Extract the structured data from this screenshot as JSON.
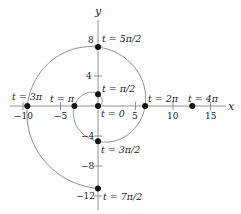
{
  "chart_data": {
    "type": "line",
    "title": "",
    "xlabel": "x",
    "ylabel": "y",
    "xlim": [
      -12,
      17
    ],
    "ylim": [
      -14,
      13
    ],
    "grid": false,
    "x_ticks": [
      -10,
      -5,
      5,
      10,
      15
    ],
    "x_tick_labels": [
      "−10",
      "−5",
      "5",
      "10",
      "15"
    ],
    "y_ticks": [
      8,
      4,
      -4,
      -8,
      -12
    ],
    "y_tick_labels": [
      "8",
      "4",
      "−4",
      "−8",
      "−12"
    ],
    "series": [
      {
        "name": "spiral",
        "param": "t",
        "t_range": [
          0,
          10.9956
        ],
        "x_expr": "t*cos(t)",
        "y_expr": "t*sin(t)",
        "color": "#888888"
      }
    ],
    "points": [
      {
        "label": "t = 0",
        "x": 0,
        "y": 0
      },
      {
        "label": "t = π/2",
        "x": 0,
        "y": 1.5708
      },
      {
        "label": "t = π",
        "x": -3.1416,
        "y": 0
      },
      {
        "label": "t = 3π/2",
        "x": 0,
        "y": -4.7124
      },
      {
        "label": "t = 2π",
        "x": 6.2832,
        "y": 0
      },
      {
        "label": "t = 5π/2",
        "x": 0,
        "y": 7.854
      },
      {
        "label": "t = 3π",
        "x": -9.4248,
        "y": 0
      },
      {
        "label": "t = 7π/2",
        "x": 0,
        "y": -10.9956
      },
      {
        "label": "t = 4π",
        "x": 12.5664,
        "y": 0
      }
    ]
  },
  "labels": {
    "x_axis": "x",
    "y_axis": "y",
    "t0": "t = 0",
    "t_pi_2": "t = π/2",
    "t_pi": "t = π",
    "t_3pi_2": "t = 3π/2",
    "t_2pi": "t = 2π",
    "t_5pi_2": "t = 5π/2",
    "t_3pi": "t = 3π",
    "t_7pi_2": "t = 7π/2",
    "t_4pi": "t = 4π",
    "xt_m10": "−10",
    "xt_m5": "−5",
    "xt_5": "5",
    "xt_10": "10",
    "xt_15": "15",
    "yt_8": "8",
    "yt_4": "4",
    "yt_m4": "−4",
    "yt_m8": "−8",
    "yt_m12": "−12"
  }
}
